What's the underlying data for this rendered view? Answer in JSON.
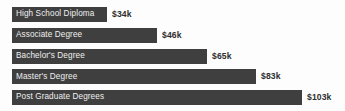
{
  "chart_data": {
    "type": "bar",
    "orientation": "horizontal",
    "title": "",
    "xlabel": "",
    "ylabel": "",
    "grid": false,
    "legend": false,
    "axis_visible": false,
    "unit": "k",
    "currency": "$",
    "xlim": [
      0,
      110
    ],
    "categories": [
      "High School Diploma",
      "Associate Degree",
      "Bachelor's Degree",
      "Master's Degree",
      "Post Graduate Degrees"
    ],
    "values": [
      34,
      46,
      65,
      83,
      103
    ],
    "value_labels": [
      "$34k",
      "$46k",
      "$65k",
      "$83k",
      "$103k"
    ],
    "bar_widths_px": [
      95,
      145,
      195,
      244,
      290
    ],
    "colors": {
      "bar": "#3f3f3f",
      "bar_label_text": "#efefef",
      "value_label_text": "#2e2e2e",
      "background": "#fdfdfd"
    }
  }
}
